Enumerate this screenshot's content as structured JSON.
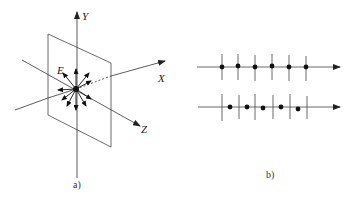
{
  "figure_a": {
    "caption": "a)",
    "axis_labels": {
      "x": "X",
      "y": "Y",
      "z": "Z"
    },
    "field_label": "E",
    "description": "Point charge at origin with radial field arrows, crossed by a vertical plane"
  },
  "figure_b": {
    "caption": "b)",
    "rows": [
      {
        "name": "aligned",
        "tick_x": [
          222,
          237,
          254,
          272,
          289,
          306
        ],
        "dot_x": [
          222,
          237,
          254,
          272,
          289,
          306
        ],
        "dot_y": [
          67,
          67,
          67,
          67,
          67,
          67
        ]
      },
      {
        "name": "offset",
        "tick_x": [
          222,
          239,
          255,
          273,
          290,
          307
        ],
        "dot_x": [
          230,
          247,
          263,
          281,
          298
        ],
        "dot_y": [
          107,
          107,
          107,
          107,
          109
        ]
      }
    ]
  },
  "colors": {
    "stroke": "#333333",
    "dot": "#111111",
    "background": "#ffffff"
  }
}
